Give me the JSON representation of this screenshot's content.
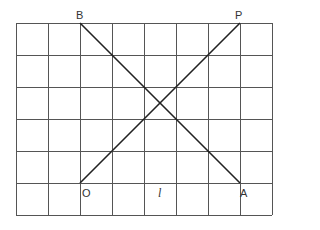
{
  "diagram": {
    "type": "grid-with-crossing-lines",
    "grid": {
      "columns": 8,
      "rows": 6,
      "x_lines": [
        16,
        48,
        80,
        112,
        144,
        176,
        208,
        240,
        272
      ],
      "y_lines": [
        23,
        55,
        87,
        119,
        151,
        183,
        215
      ],
      "line_color": "#555555"
    },
    "points": {
      "B": {
        "label": "B",
        "x": 80,
        "y": 23
      },
      "P": {
        "label": "P",
        "x": 240,
        "y": 23
      },
      "O": {
        "label": "O",
        "x": 80,
        "y": 183
      },
      "A": {
        "label": "A",
        "x": 240,
        "y": 183
      }
    },
    "segments": [
      {
        "name": "BA",
        "from": "B",
        "to": "A"
      },
      {
        "name": "OP",
        "from": "O",
        "to": "P"
      }
    ],
    "line_label": "l",
    "segment_color": "#222222"
  }
}
